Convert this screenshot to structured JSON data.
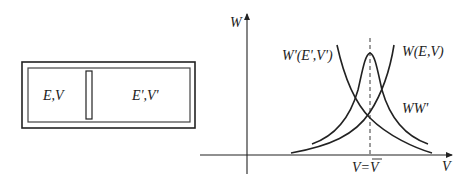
{
  "box": {
    "left_label": "E,V",
    "right_label": "E',V'"
  },
  "graph": {
    "y_axis_label": "W",
    "x_axis_label": "V",
    "curve_labels": {
      "w_prime": "W'(E',V')",
      "w": "W(E,V)",
      "product": "WW'"
    },
    "equilibrium_label": "V=V̄"
  },
  "colors": {
    "stroke": "#222222",
    "background": "#ffffff"
  }
}
